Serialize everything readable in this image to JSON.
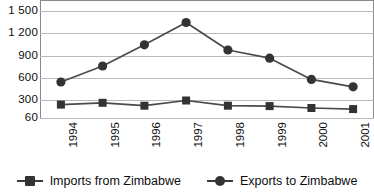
{
  "chart_data": {
    "type": "line",
    "title": "",
    "subtitle": "",
    "xlabel": "",
    "ylabel": "",
    "categories": [
      "1994",
      "1995",
      "1996",
      "1997",
      "1998",
      "1999",
      "2000",
      "2001"
    ],
    "series": [
      {
        "name": "Imports from Zimbabwe",
        "marker": "square",
        "color": "#333333",
        "values": [
          240,
          265,
          225,
          295,
          225,
          220,
          195,
          180
        ]
      },
      {
        "name": "Exports to Zimbabwe",
        "marker": "circle",
        "color": "#333333",
        "values": [
          545,
          760,
          1045,
          1345,
          975,
          865,
          580,
          480
        ]
      }
    ],
    "ylim": [
      60,
      1560
    ],
    "yticks": [
      1500,
      1200,
      900,
      600,
      300,
      60
    ],
    "ytick_labels": [
      "1 500",
      "1 200",
      "900",
      "600",
      "300",
      "60"
    ],
    "grid": "horizontal",
    "legend_position": "bottom"
  },
  "axes": {
    "y_labels": [
      "1 500",
      "1 200",
      "900",
      "600",
      "300",
      "60"
    ],
    "x_labels": [
      "1994",
      "1995",
      "1996",
      "1997",
      "1998",
      "1999",
      "2000",
      "2001"
    ]
  },
  "legend": {
    "entries": [
      {
        "label": "Imports from Zimbabwe",
        "marker": "square"
      },
      {
        "label": "Exports to Zimbabwe",
        "marker": "circle"
      }
    ]
  },
  "colors": {
    "series": "#333333",
    "line": "#4a4a4a",
    "grid": "#b9b9b9",
    "axis": "#8a8a8a",
    "text": "#0d0d0d",
    "background": "#ffffff"
  }
}
